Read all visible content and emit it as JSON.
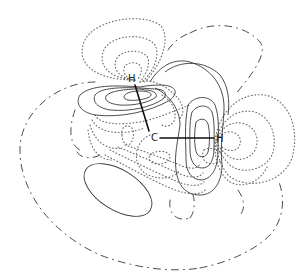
{
  "figure": {
    "type": "molecular orbital contour plot",
    "atoms": [
      {
        "id": "h_upper",
        "label": "H",
        "x": 131,
        "y": 82
      },
      {
        "id": "c_center",
        "label": "C",
        "x": 151,
        "y": 141
      },
      {
        "id": "h_right",
        "label": "H",
        "x": 218,
        "y": 142
      }
    ],
    "bonds": [
      {
        "from": "c_center",
        "to": "h_upper"
      },
      {
        "from": "c_center",
        "to": "h_right"
      }
    ],
    "line_styles": {
      "solid": "positive contours",
      "dotted": "negative contours",
      "dash_dot": "nodal / outer boundary"
    },
    "colors": {
      "background": "#ffffff",
      "lines": "#3a3a3a",
      "bonds": "#111111"
    }
  }
}
